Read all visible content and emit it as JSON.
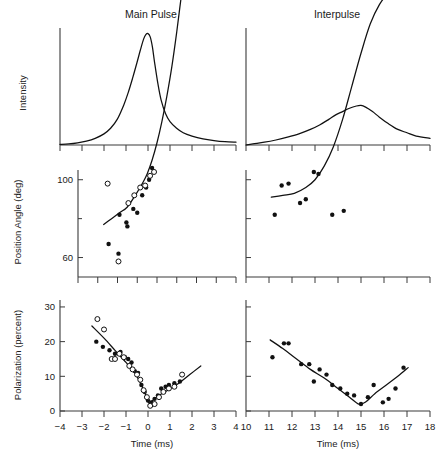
{
  "figure": {
    "background": "#ffffff",
    "ink": "#111111",
    "panel_titles": {
      "left": "Main Pulse",
      "right": "Interpulse"
    },
    "axis_labels": {
      "intensity": "Intensity",
      "position_angle": "Position Angle (deg)",
      "polarization": "Polarization (percent)",
      "time_left": "Time (ms)",
      "time_right": "Time (ms)"
    }
  },
  "chart_data": [
    {
      "id": "intensity-main-pulse",
      "type": "line",
      "title": "Main Pulse",
      "xlabel": "Time (ms)",
      "ylabel": "Intensity",
      "xlim": [
        -4,
        4
      ],
      "ylim": [
        0,
        1.05
      ],
      "xticks": [
        -4,
        -3,
        -2,
        -1,
        0,
        1,
        2,
        3,
        4
      ],
      "xticklabels": [
        "",
        "",
        "",
        "",
        "",
        "",
        "",
        "",
        ""
      ],
      "yticks": [],
      "grid": false,
      "legend": "none",
      "x": [
        -4.0,
        -3.6,
        -3.2,
        -2.8,
        -2.4,
        -2.0,
        -1.7,
        -1.4,
        -1.1,
        -0.9,
        -0.7,
        -0.5,
        -0.35,
        -0.2,
        -0.1,
        0.0,
        0.1,
        0.2,
        0.3,
        0.45,
        0.6,
        0.8,
        1.0,
        1.3,
        1.6,
        2.0,
        2.5,
        3.0,
        3.5,
        4.0
      ],
      "y": [
        0.005,
        0.01,
        0.02,
        0.035,
        0.06,
        0.1,
        0.15,
        0.23,
        0.36,
        0.47,
        0.6,
        0.74,
        0.85,
        0.95,
        0.99,
        1.0,
        0.97,
        0.88,
        0.74,
        0.55,
        0.4,
        0.28,
        0.21,
        0.15,
        0.11,
        0.08,
        0.055,
        0.04,
        0.03,
        0.025
      ]
    },
    {
      "id": "intensity-interpulse",
      "type": "line",
      "title": "Interpulse",
      "xlabel": "Time (ms)",
      "ylabel": "Intensity",
      "xlim": [
        10,
        18
      ],
      "ylim": [
        0,
        1.05
      ],
      "xticks": [
        10,
        11,
        12,
        13,
        14,
        15,
        16,
        17,
        18
      ],
      "xticklabels": [
        "",
        "",
        "",
        "",
        "",
        "",
        "",
        "",
        ""
      ],
      "yticks": [],
      "grid": false,
      "legend": "none",
      "x": [
        10.0,
        10.3,
        10.8,
        11.3,
        11.8,
        12.3,
        12.8,
        13.2,
        13.6,
        13.9,
        14.2,
        14.5,
        14.8,
        15.0,
        15.2,
        15.5,
        15.8,
        16.2,
        16.6,
        17.0,
        17.4,
        18.0
      ],
      "y": [
        0.0,
        0.01,
        0.025,
        0.045,
        0.07,
        0.1,
        0.14,
        0.18,
        0.23,
        0.27,
        0.3,
        0.33,
        0.35,
        0.355,
        0.34,
        0.3,
        0.25,
        0.19,
        0.14,
        0.11,
        0.08,
        0.06
      ]
    },
    {
      "id": "position-angle-main-pulse",
      "type": "scatter",
      "title": "Main Pulse",
      "xlabel": "Time (ms)",
      "ylabel": "Position Angle (deg)",
      "xlim": [
        -4,
        4
      ],
      "ylim": [
        50,
        105
      ],
      "xticks": [
        -4,
        -3,
        -2,
        -1,
        0,
        1,
        2,
        3,
        4
      ],
      "xticklabels": [
        "",
        "",
        "",
        "",
        "",
        "",
        "",
        "",
        ""
      ],
      "yticks": [
        60,
        100,
        140,
        180,
        40,
        80
      ],
      "ytickvalues": [
        60,
        100,
        140,
        180,
        220,
        260
      ],
      "yticklabels": [
        "60",
        "100",
        "140",
        "180",
        "40",
        "80"
      ],
      "note": "Position angle wraps modulo 180 deg; ticks above 180 are labelled 40 and 80",
      "grid": false,
      "legend": "none",
      "series": [
        {
          "name": "filled",
          "marker": "filled-circle",
          "points": [
            [
              -2.45,
              67
            ],
            [
              -1.95,
              62
            ],
            [
              -1.9,
              82
            ],
            [
              -1.55,
              78
            ],
            [
              -1.5,
              76
            ],
            [
              -1.2,
              85
            ],
            [
              -1.0,
              83
            ],
            [
              -0.75,
              92
            ],
            [
              -0.55,
              96
            ],
            [
              -0.4,
              100
            ],
            [
              -0.25,
              106
            ],
            [
              -0.1,
              112
            ],
            [
              0.0,
              118
            ],
            [
              0.15,
              126
            ],
            [
              0.3,
              131
            ],
            [
              0.45,
              135
            ],
            [
              0.6,
              140
            ],
            [
              0.75,
              147
            ],
            [
              0.95,
              152
            ],
            [
              1.0,
              192
            ],
            [
              1.15,
              148
            ],
            [
              1.3,
              212
            ],
            [
              1.45,
              255
            ],
            [
              1.75,
              238
            ],
            [
              2.05,
              228
            ]
          ]
        },
        {
          "name": "open",
          "marker": "open-circle",
          "points": [
            [
              -2.5,
              98
            ],
            [
              -1.95,
              58
            ],
            [
              -1.45,
              88
            ],
            [
              -1.15,
              92
            ],
            [
              -0.85,
              96
            ],
            [
              -0.6,
              97
            ],
            [
              -0.35,
              102
            ],
            [
              -0.15,
              104
            ],
            [
              0.05,
              112
            ],
            [
              0.2,
              120
            ],
            [
              0.5,
              138
            ],
            [
              0.65,
              144
            ],
            [
              0.85,
              152
            ],
            [
              1.05,
              158
            ],
            [
              1.25,
              170
            ],
            [
              1.5,
              222
            ],
            [
              1.8,
              205
            ],
            [
              2.1,
              215
            ]
          ]
        }
      ],
      "fit_curve": {
        "x": [
          -2.7,
          -2.3,
          -1.9,
          -1.5,
          -1.1,
          -0.8,
          -0.5,
          -0.25,
          0.0,
          0.25,
          0.5,
          0.75,
          1.0,
          1.25,
          1.5,
          1.8,
          2.1,
          2.4
        ],
        "y": [
          77,
          80,
          83,
          86,
          92,
          97,
          103,
          110,
          119,
          130,
          143,
          158,
          176,
          196,
          214,
          230,
          240,
          246
        ]
      }
    },
    {
      "id": "position-angle-interpulse",
      "type": "scatter",
      "title": "Interpulse",
      "xlabel": "Time (ms)",
      "ylabel": "Position Angle (deg)",
      "xlim": [
        10,
        18
      ],
      "ylim": [
        50,
        105
      ],
      "xticks": [
        10,
        11,
        12,
        13,
        14,
        15,
        16,
        17,
        18
      ],
      "xticklabels": [
        "",
        "",
        "",
        "",
        "",
        "",
        "",
        "",
        ""
      ],
      "yticks": [
        60,
        100,
        140,
        180,
        40,
        80
      ],
      "grid": false,
      "legend": "none",
      "series": [
        {
          "name": "filled",
          "marker": "filled-circle",
          "points": [
            [
              11.25,
              82
            ],
            [
              11.55,
              97
            ],
            [
              11.85,
              98
            ],
            [
              12.35,
              88
            ],
            [
              12.6,
              90
            ],
            [
              12.95,
              104
            ],
            [
              13.15,
              103
            ],
            [
              13.4,
              108
            ],
            [
              13.6,
              120
            ],
            [
              13.75,
              82
            ],
            [
              13.95,
              112
            ],
            [
              14.25,
              84
            ],
            [
              14.45,
              145
            ],
            [
              14.7,
              160
            ],
            [
              15.0,
              130
            ],
            [
              15.35,
              195
            ],
            [
              15.85,
              150
            ],
            [
              16.1,
              152
            ],
            [
              16.4,
              190
            ],
            [
              16.75,
              196
            ]
          ]
        }
      ],
      "fit_curve": {
        "x": [
          11.1,
          11.6,
          12.1,
          12.6,
          13.0,
          13.4,
          13.8,
          14.2,
          14.6,
          15.0,
          15.4,
          15.8,
          16.2,
          16.6,
          17.0
        ],
        "y": [
          91,
          92,
          93,
          96,
          100,
          107,
          117,
          131,
          148,
          165,
          180,
          190,
          196,
          199,
          199
        ]
      }
    },
    {
      "id": "polarization-main-pulse",
      "type": "scatter",
      "title": "Main Pulse",
      "xlabel": "Time (ms)",
      "ylabel": "Polarization (percent)",
      "xlim": [
        -4,
        4
      ],
      "ylim": [
        0,
        32
      ],
      "xticks": [
        -4,
        -3,
        -2,
        -1,
        0,
        1,
        2,
        3,
        4
      ],
      "xticklabels": [
        "-4",
        "-3",
        "-2",
        "-1",
        "0",
        "1",
        "2",
        "3",
        "4"
      ],
      "yticks": [
        0,
        10,
        20,
        30
      ],
      "yticklabels": [
        "0",
        "10",
        "20",
        "30"
      ],
      "grid": false,
      "legend": "none",
      "series": [
        {
          "name": "filled",
          "marker": "filled-circle",
          "points": [
            [
              -2.35,
              20.0
            ],
            [
              -2.05,
              18.5
            ],
            [
              -1.75,
              17.5
            ],
            [
              -1.5,
              16.5
            ],
            [
              -1.25,
              17.0
            ],
            [
              -1.05,
              15.5
            ],
            [
              -0.9,
              15.0
            ],
            [
              -0.75,
              14.0
            ],
            [
              -0.6,
              11.5
            ],
            [
              -0.45,
              11.0
            ],
            [
              -0.3,
              7.5
            ],
            [
              -0.15,
              5.5
            ],
            [
              0.0,
              3.0
            ],
            [
              0.15,
              2.5
            ],
            [
              0.3,
              3.5
            ],
            [
              0.45,
              4.5
            ],
            [
              0.6,
              6.5
            ],
            [
              0.8,
              7.0
            ],
            [
              0.95,
              7.5
            ],
            [
              1.2,
              8.0
            ],
            [
              1.45,
              8.5
            ]
          ]
        },
        {
          "name": "open",
          "marker": "open-circle",
          "points": [
            [
              -2.3,
              26.5
            ],
            [
              -2.0,
              23.5
            ],
            [
              -1.65,
              15.0
            ],
            [
              -1.5,
              15.0
            ],
            [
              -1.3,
              16.5
            ],
            [
              -1.1,
              15.5
            ],
            [
              -0.85,
              13.0
            ],
            [
              -0.7,
              12.0
            ],
            [
              -0.5,
              10.5
            ],
            [
              -0.35,
              9.0
            ],
            [
              -0.2,
              6.0
            ],
            [
              -0.05,
              4.0
            ],
            [
              0.1,
              1.5
            ],
            [
              0.3,
              2.0
            ],
            [
              0.5,
              4.0
            ],
            [
              0.7,
              5.5
            ],
            [
              0.95,
              6.5
            ],
            [
              1.2,
              7.0
            ],
            [
              1.55,
              10.5
            ]
          ]
        }
      ],
      "fit_curve": {
        "x": [
          -2.55,
          -2.0,
          -1.5,
          -1.0,
          -0.6,
          -0.3,
          -0.1,
          0.05,
          0.2,
          0.5,
          0.9,
          1.4,
          1.9,
          2.4
        ],
        "y": [
          24.5,
          21.0,
          17.5,
          14.0,
          11.0,
          7.5,
          4.5,
          2.2,
          3.0,
          4.5,
          6.0,
          8.0,
          10.5,
          13.0
        ]
      }
    },
    {
      "id": "polarization-interpulse",
      "type": "scatter",
      "title": "Interpulse",
      "xlabel": "Time (ms)",
      "ylabel": "Polarization (percent)",
      "xlim": [
        10,
        18
      ],
      "ylim": [
        0,
        32
      ],
      "xticks": [
        10,
        11,
        12,
        13,
        14,
        15,
        16,
        17,
        18
      ],
      "xticklabels": [
        "10",
        "11",
        "12",
        "13",
        "14",
        "15",
        "16",
        "17",
        "18"
      ],
      "yticks": [
        0,
        10,
        20,
        30
      ],
      "grid": false,
      "legend": "none",
      "series": [
        {
          "name": "filled",
          "marker": "filled-circle",
          "points": [
            [
              11.15,
              15.5
            ],
            [
              11.65,
              19.5
            ],
            [
              11.85,
              19.5
            ],
            [
              12.4,
              13.5
            ],
            [
              12.75,
              13.5
            ],
            [
              12.95,
              8.5
            ],
            [
              13.2,
              12.0
            ],
            [
              13.5,
              10.5
            ],
            [
              13.75,
              7.5
            ],
            [
              14.1,
              6.5
            ],
            [
              14.4,
              5.0
            ],
            [
              14.7,
              4.5
            ],
            [
              15.0,
              2.0
            ],
            [
              15.3,
              4.0
            ],
            [
              15.55,
              7.5
            ],
            [
              15.95,
              2.5
            ],
            [
              16.2,
              3.5
            ],
            [
              16.5,
              6.5
            ],
            [
              16.85,
              12.5
            ]
          ]
        }
      ],
      "fit_curve": {
        "x": [
          11.05,
          11.6,
          12.2,
          12.8,
          13.4,
          14.0,
          14.5,
          14.9,
          15.2,
          15.6,
          16.1,
          16.6,
          17.05
        ],
        "y": [
          20.5,
          18.0,
          15.0,
          12.0,
          9.5,
          6.5,
          4.0,
          2.0,
          2.6,
          5.0,
          7.5,
          10.0,
          12.5
        ]
      }
    }
  ]
}
